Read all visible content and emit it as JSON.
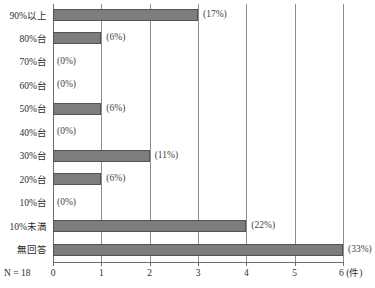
{
  "chart_data": {
    "type": "bar",
    "orientation": "horizontal",
    "title": "",
    "xlabel": "件",
    "ylabel": "",
    "xlim": [
      0,
      6
    ],
    "xticks": [
      "0",
      "1",
      "2",
      "3",
      "4",
      "5",
      "6"
    ],
    "x_unit_label": "6 (件)",
    "grid": true,
    "legend": "none",
    "sample_size_label": "N = 18",
    "bar_color": "#7d7d7d",
    "bar_border_color": "#545454",
    "grid_color": "#8c8c8c",
    "categories": [
      "90%以上",
      "80%台",
      "70%台",
      "60%台",
      "50%台",
      "40%台",
      "30%台",
      "20%台",
      "10%台",
      "10%未満",
      "無回答"
    ],
    "values": [
      3,
      1,
      0,
      0,
      1,
      0,
      2,
      1,
      0,
      4,
      6
    ],
    "data_labels": [
      "(17%)",
      "(6%)",
      "(0%)",
      "(0%)",
      "(6%)",
      "(0%)",
      "(11%)",
      "(6%)",
      "(0%)",
      "(22%)",
      "(33%)"
    ]
  }
}
